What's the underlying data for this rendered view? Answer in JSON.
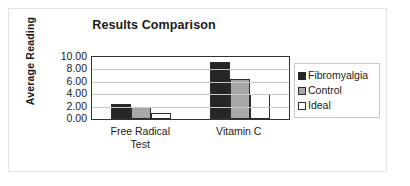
{
  "chart_data": {
    "type": "bar",
    "title": "Results Comparison",
    "xlabel": "",
    "ylabel": "Average Reading",
    "categories": [
      "Free Radical Test",
      "Vitamin C"
    ],
    "category_lines": [
      [
        "Free Radical",
        "Test"
      ],
      [
        "Vitamin C"
      ]
    ],
    "series": [
      {
        "name": "Fibromyalgia",
        "color": "#262626",
        "values": [
          2.4,
          9.2
        ]
      },
      {
        "name": "Control",
        "color": "#a8a8a8",
        "values": [
          1.9,
          6.5
        ]
      },
      {
        "name": "Ideal",
        "color": "#ffffff",
        "values": [
          0.9,
          4.0
        ]
      }
    ],
    "ylim": [
      0,
      10
    ],
    "ytick_labels": [
      "10.00",
      "8.00",
      "6.00",
      "4.00",
      "2.00",
      "0.00"
    ],
    "ytick_values": [
      10,
      8,
      6,
      4,
      2,
      0
    ],
    "grid": true,
    "legend_position": "right",
    "legend_entries": [
      "Fibromyalgia",
      "Control",
      "Ideal"
    ]
  }
}
